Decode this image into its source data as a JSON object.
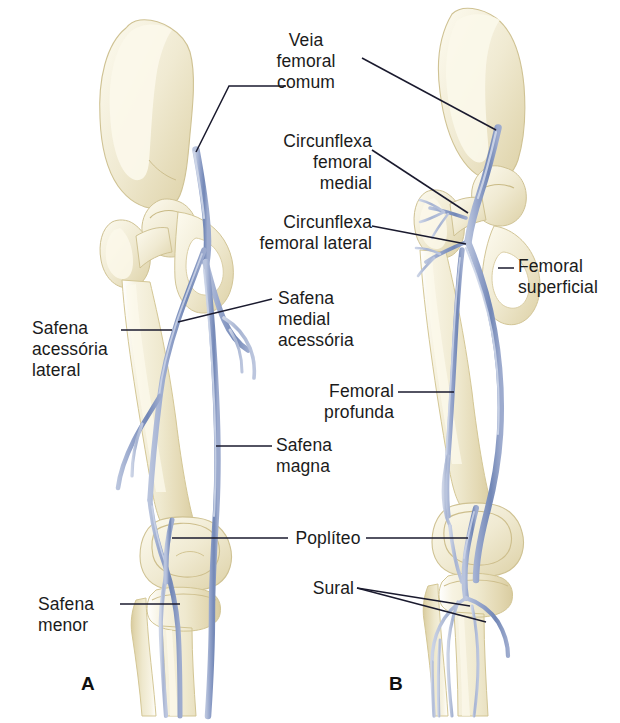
{
  "figure": {
    "language": "pt-BR",
    "panels": [
      {
        "id": "A",
        "letter": "A",
        "view": "sistema venoso superficial"
      },
      {
        "id": "B",
        "letter": "B",
        "view": "sistema venoso profundo"
      }
    ]
  },
  "colors": {
    "bone": "#f0ebd5",
    "bone_shade": "#e2d9b4",
    "bone_outline": "#d8cda6",
    "vein": "#8b9cc6",
    "vein_dark": "#6c7fae",
    "vein_light": "#b9c4dd",
    "leader": "#1a1a2e",
    "text": "#1b1b1b",
    "background": "#ffffff"
  },
  "labels": [
    {
      "id": "veia-femoral-comum",
      "text": "Veia\nfemoral\ncomum",
      "align": "center",
      "panel": "both"
    },
    {
      "id": "circunflexa-femoral-medial",
      "text": "Circunflexa\nfemoral\nmedial",
      "align": "right",
      "panel": "B"
    },
    {
      "id": "circunflexa-femoral-lateral",
      "text": "Circunflexa\nfemoral lateral",
      "align": "right",
      "panel": "B"
    },
    {
      "id": "safena-medial-acessoria",
      "text": "Safena\nmedial\nacessória",
      "align": "left",
      "panel": "A"
    },
    {
      "id": "femoral-profunda",
      "text": "Femoral\nprofunda",
      "align": "right",
      "panel": "B"
    },
    {
      "id": "safena-magna",
      "text": "Safena\nmagna",
      "align": "left",
      "panel": "A"
    },
    {
      "id": "popliteo",
      "text": "Poplíteo",
      "align": "center",
      "panel": "both"
    },
    {
      "id": "sural",
      "text": "Sural",
      "align": "right",
      "panel": "B"
    },
    {
      "id": "safena-acessoria-lateral",
      "text": "Safena\nacessória\nlateral",
      "align": "left",
      "panel": "A"
    },
    {
      "id": "safena-menor",
      "text": "Safena\nmenor",
      "align": "left",
      "panel": "A"
    },
    {
      "id": "femoral-superficial",
      "text": "Femoral\nsuperficial",
      "align": "left",
      "panel": "B"
    }
  ],
  "label_text": {
    "veia_femoral_comum": "Veia\nfemoral\ncomum",
    "circunflexa_femoral_medial": "Circunflexa\nfemoral\nmedial",
    "circunflexa_femoral_lateral": "Circunflexa\nfemoral lateral",
    "safena_medial_acessoria": "Safena\nmedial\nacessória",
    "femoral_profunda": "Femoral\nprofunda",
    "safena_magna": "Safena\nmagna",
    "popliteo": "Poplíteo",
    "sural": "Sural",
    "safena_acessoria_lateral": "Safena\nacessória\nlateral",
    "safena_menor": "Safena\nmenor",
    "femoral_superficial": "Femoral\nsuperficial",
    "panel_a": "A",
    "panel_b": "B"
  }
}
